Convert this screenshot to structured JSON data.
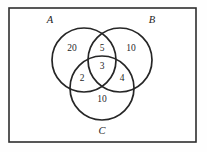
{
  "figure": {
    "type": "venn-diagram",
    "background_color": "#fefefe",
    "stroke_color": "#262626",
    "frame_color": "#2e2e2e"
  },
  "universe": {
    "shape": "rectangle",
    "x": 9,
    "y": 8,
    "width": 187,
    "height": 134
  },
  "sets": [
    {
      "id": "A",
      "label": "A",
      "label_x": 50,
      "label_y": 21,
      "cx": 84,
      "cy": 60,
      "r": 32
    },
    {
      "id": "B",
      "label": "B",
      "label_x": 152,
      "label_y": 21,
      "cx": 120,
      "cy": 60,
      "r": 32
    },
    {
      "id": "C",
      "label": "C",
      "label_x": 102,
      "label_y": 132,
      "cx": 102,
      "cy": 88,
      "r": 32
    }
  ],
  "regions": [
    {
      "id": "A-only",
      "label": "20",
      "value": 20,
      "x": 72,
      "y": 49
    },
    {
      "id": "AB-only",
      "label": "5",
      "value": 5,
      "x": 102,
      "y": 49
    },
    {
      "id": "B-only",
      "label": "10",
      "value": 10,
      "x": 131,
      "y": 49
    },
    {
      "id": "AC-only",
      "label": "2",
      "value": 2,
      "x": 82,
      "y": 79
    },
    {
      "id": "ABC",
      "label": "3",
      "value": 3,
      "x": 102,
      "y": 67
    },
    {
      "id": "BC-only",
      "label": "4",
      "value": 4,
      "x": 122,
      "y": 79
    },
    {
      "id": "C-only",
      "label": "10",
      "value": 10,
      "x": 102,
      "y": 100
    }
  ]
}
